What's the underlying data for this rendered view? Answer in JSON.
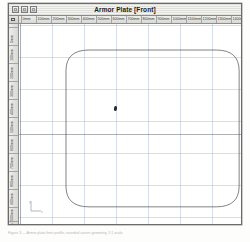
{
  "window": {
    "title": "Armor Plate [Front]",
    "controls": [
      {
        "name": "close-button",
        "label": ""
      },
      {
        "name": "minimize-button",
        "label": ""
      },
      {
        "name": "zoom-button",
        "label": ""
      }
    ]
  },
  "rulers": {
    "unit_corner_icon": "ruler-unit-icon",
    "horizontal": {
      "labels": [
        "0mm",
        "100mm",
        "200mm",
        "300mm",
        "400mm",
        "500mm",
        "600mm",
        "700mm",
        "800mm",
        "900mm",
        "1000mm",
        "1100mm",
        "1200mm",
        "1300mm",
        "1400mm"
      ],
      "positions": [
        2,
        17,
        32,
        47,
        62,
        77,
        92,
        107,
        122,
        137,
        152,
        167,
        182,
        197,
        212
      ]
    },
    "vertical": {
      "labels": [
        "0mm",
        "100mm",
        "200mm",
        "300mm",
        "400mm",
        "500mm",
        "600mm",
        "700mm",
        "800mm",
        "900mm",
        "1000mm",
        "1100mm"
      ],
      "positions": [
        3,
        21,
        39,
        57,
        75,
        93,
        111,
        129,
        147,
        165,
        183,
        197
      ]
    }
  },
  "canvas": {
    "grid_spacing_px": 32,
    "grid_color": "#7896b9",
    "background": "#ffffff",
    "axis_color": "#6e6e78",
    "shape": {
      "name": "armor-plate-outline",
      "type": "rounded-rectangle",
      "stroke": "#4a4a4a",
      "fill": "none",
      "x": 127,
      "y": 78,
      "width": 468,
      "height": 470,
      "corner_radius": 62
    },
    "cursor": {
      "name": "pointer-cursor",
      "x": 95,
      "y": 82
    },
    "origin_marker": {
      "name": "origin-axis-indicator",
      "x_label": "x",
      "y_label": "y"
    }
  },
  "caption": {
    "text": "Figure 3 — Armor plate front profile, rounded corner geometry, 1:1 scale"
  }
}
